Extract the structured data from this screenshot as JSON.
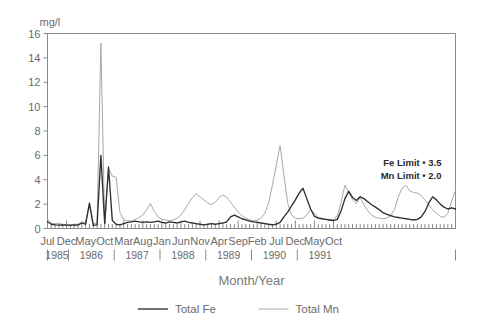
{
  "chart_data": {
    "type": "line",
    "title": "",
    "xlabel": "Month/Year",
    "ylabel": "mg/l",
    "ylim": [
      0,
      16
    ],
    "yticks": [
      0,
      2,
      4,
      6,
      8,
      10,
      12,
      14,
      16
    ],
    "grid": false,
    "legend_position": "bottom",
    "x_start": "1985-07",
    "x_end": "1991-12",
    "xtick_labels": [
      "Jul",
      "Dec",
      "May",
      "Oct",
      "Mar",
      "Aug",
      "Jan",
      "Jun",
      "Nov",
      "Apr",
      "Sep",
      "Feb",
      "Jul",
      "Dec",
      "May",
      "Oct"
    ],
    "xtick_indices": [
      0,
      5,
      10,
      15,
      20,
      25,
      30,
      35,
      40,
      45,
      50,
      55,
      60,
      65,
      70,
      75
    ],
    "year_labels": [
      "1985",
      "1986",
      "1987",
      "1988",
      "1989",
      "1990",
      "1991"
    ],
    "annotations": [
      "Fe Limit • 3.5",
      "Mn Limit • 2.0"
    ],
    "series": [
      {
        "name": "Total Fe",
        "color": "#2f2f2f",
        "values": [
          0.55,
          0.35,
          0.3,
          0.28,
          0.3,
          0.28,
          0.25,
          0.3,
          0.28,
          0.45,
          0.35,
          2.05,
          0.25,
          0.3,
          6.0,
          0.4,
          5.05,
          0.65,
          0.35,
          0.3,
          0.4,
          0.5,
          0.55,
          0.6,
          0.55,
          0.5,
          0.55,
          0.5,
          0.55,
          0.6,
          0.5,
          0.45,
          0.55,
          0.5,
          0.45,
          0.55,
          0.6,
          0.5,
          0.45,
          0.4,
          0.35,
          0.3,
          0.35,
          0.4,
          0.35,
          0.4,
          0.45,
          0.55,
          0.95,
          1.1,
          0.95,
          0.8,
          0.7,
          0.6,
          0.55,
          0.5,
          0.45,
          0.4,
          0.35,
          0.3,
          0.35,
          0.5,
          0.95,
          1.35,
          1.85,
          2.35,
          2.9,
          3.3,
          2.45,
          1.6,
          1.0,
          0.85,
          0.8,
          0.75,
          0.7,
          0.65,
          0.75,
          1.45,
          2.45,
          3.05,
          2.55,
          2.3,
          2.6,
          2.45,
          2.2,
          1.95,
          1.75,
          1.55,
          1.3,
          1.15,
          1.05,
          0.95,
          0.9,
          0.85,
          0.8,
          0.75,
          0.7,
          0.75,
          0.95,
          1.4,
          2.1,
          2.6,
          2.35,
          2.0,
          1.75,
          1.6,
          1.7,
          1.6
        ]
      },
      {
        "name": "Total Mn",
        "color": "#a8a8a8",
        "values": [
          0.75,
          0.45,
          0.4,
          0.4,
          0.35,
          0.3,
          0.3,
          0.35,
          0.35,
          0.55,
          0.5,
          2.15,
          0.4,
          0.45,
          15.2,
          0.45,
          4.95,
          4.3,
          4.2,
          1.3,
          0.7,
          0.65,
          0.6,
          0.75,
          0.9,
          1.1,
          1.55,
          2.05,
          1.4,
          0.95,
          0.75,
          0.7,
          0.65,
          0.7,
          0.85,
          1.1,
          1.55,
          2.05,
          2.55,
          2.85,
          2.6,
          2.35,
          2.1,
          1.95,
          2.15,
          2.55,
          2.75,
          2.55,
          2.15,
          1.75,
          1.35,
          1.05,
          0.85,
          0.7,
          0.65,
          0.7,
          0.85,
          1.25,
          2.1,
          3.6,
          5.2,
          6.8,
          4.4,
          2.05,
          1.1,
          0.85,
          0.8,
          0.85,
          1.1,
          1.55,
          1.25,
          0.95,
          0.8,
          0.75,
          0.7,
          0.75,
          1.05,
          2.15,
          3.55,
          2.95,
          2.35,
          2.05,
          2.55,
          1.95,
          1.45,
          1.1,
          0.9,
          0.85,
          0.8,
          0.85,
          1.05,
          1.55,
          2.6,
          3.3,
          3.55,
          3.1,
          2.95,
          2.9,
          2.7,
          2.35,
          1.95,
          1.55,
          1.25,
          1.0,
          0.9,
          1.25,
          2.25,
          3.15
        ]
      }
    ]
  },
  "legend": {
    "items": [
      {
        "label": "Total Fe",
        "color": "#2f2f2f"
      },
      {
        "label": "Total Mn",
        "color": "#a8a8a8"
      }
    ]
  }
}
